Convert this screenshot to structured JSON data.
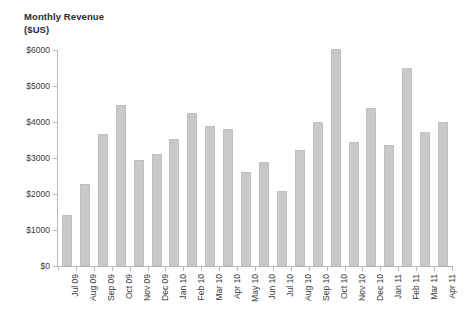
{
  "chart_data": {
    "type": "bar",
    "title": "Monthly Revenue\n($US)",
    "title_line1": "Monthly Revenue",
    "title_line2": "($US)",
    "xlabel": "",
    "ylabel": "",
    "ylim": [
      0,
      6000
    ],
    "y_ticks": [
      0,
      1000,
      2000,
      3000,
      4000,
      5000,
      6000
    ],
    "y_tick_labels": [
      "$0",
      "$1000",
      "$2000",
      "$3000",
      "$4000",
      "$5000",
      "$6000"
    ],
    "grid": false,
    "legend": "none",
    "bar_color": "#c9c9c9",
    "axis_color": "#b9b9b9",
    "text_color": "#3a3a3a",
    "categories": [
      "Jul 09",
      "Aug 09",
      "Sep 09",
      "Oct 09",
      "Nov 09",
      "Dec 09",
      "Jan 10",
      "Feb 10",
      "Mar 10",
      "Apr 10",
      "May 10",
      "Jun 10",
      "Jul 10",
      "Aug 10",
      "Sep 10",
      "Oct 10",
      "Nov 10",
      "Dec 10",
      "Jan 11",
      "Feb 11",
      "Mar 11",
      "Apr 11"
    ],
    "values": [
      1420,
      2290,
      3660,
      4480,
      2940,
      3110,
      3540,
      4250,
      3890,
      3810,
      2610,
      2900,
      2090,
      3230,
      4000,
      6030,
      3450,
      4400,
      3350,
      5490,
      3710,
      4010
    ]
  }
}
